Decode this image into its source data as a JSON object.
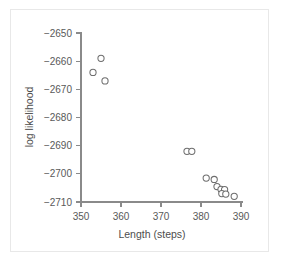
{
  "chart_data": {
    "type": "scatter",
    "title": "",
    "xlabel": "Length (steps)",
    "ylabel": "log likelihood",
    "xlim": [
      346,
      392
    ],
    "ylim": [
      -2712,
      -2648
    ],
    "xticks": [
      350,
      360,
      370,
      380,
      390
    ],
    "yticks": [
      -2650,
      -2660,
      -2670,
      -2680,
      -2690,
      -2700,
      -2710
    ],
    "xtick_labels": [
      "350",
      "360",
      "370",
      "380",
      "390"
    ],
    "ytick_labels": [
      "−2650",
      "−2660",
      "−2670",
      "−2680",
      "−2690",
      "−2700",
      "−2710"
    ],
    "grid": false,
    "legend": false,
    "marker": "open-circle",
    "marker_fill": "#ffffff",
    "marker_stroke": "#6e6e6e",
    "axis_color": "#8a8a8a",
    "background": "#ffffff",
    "border_color": "#e8e8e8",
    "points": [
      {
        "x": 355.0,
        "y": -2659.0
      },
      {
        "x": 353.0,
        "y": -2664.0
      },
      {
        "x": 356.0,
        "y": -2667.0
      },
      {
        "x": 376.5,
        "y": -2692.0
      },
      {
        "x": 377.7,
        "y": -2692.0
      },
      {
        "x": 381.3,
        "y": -2701.5
      },
      {
        "x": 383.3,
        "y": -2702.0
      },
      {
        "x": 384.0,
        "y": -2704.5
      },
      {
        "x": 385.0,
        "y": -2705.5
      },
      {
        "x": 385.9,
        "y": -2705.6
      },
      {
        "x": 385.2,
        "y": -2707.0
      },
      {
        "x": 386.2,
        "y": -2707.2
      },
      {
        "x": 388.3,
        "y": -2708.0
      }
    ]
  },
  "labels": {
    "xlabel": "Length (steps)",
    "ylabel": "log likelihood"
  }
}
